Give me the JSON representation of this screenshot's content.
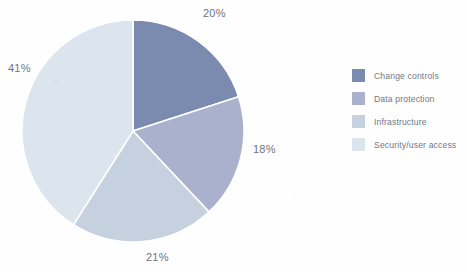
{
  "chart_data": {
    "type": "pie",
    "title": "",
    "categories": [
      "Change controls",
      "Data protection",
      "Infrastructure",
      "Security/user access"
    ],
    "values": [
      20,
      18,
      21,
      41
    ],
    "labels": [
      "20%",
      "18%",
      "21%",
      "41%"
    ],
    "unit": "percent",
    "colors": [
      "#7b8bb0",
      "#a9b1cd",
      "#c6d1df",
      "#dce4ed"
    ],
    "start_angle_deg": 0,
    "direction": "clockwise",
    "slice_border_color": "#ffffff",
    "legend_position": "right",
    "label_position": "outside",
    "label_color": "#6d7585"
  },
  "legend": {
    "items": [
      {
        "label": "Change controls",
        "color": "#7b8bb0"
      },
      {
        "label": "Data protection",
        "color": "#a9b1cd"
      },
      {
        "label": "Infrastructure",
        "color": "#c6d1df"
      },
      {
        "label": "Security/user access",
        "color": "#dce4ed"
      }
    ]
  }
}
